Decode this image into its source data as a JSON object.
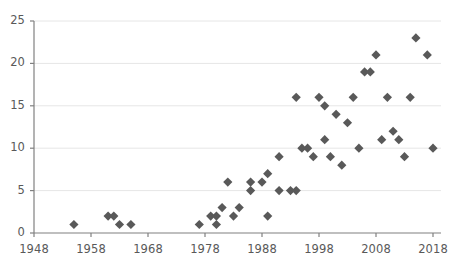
{
  "chart_data": {
    "type": "scatter",
    "title": "",
    "subtitle": "",
    "xlabel": "",
    "ylabel": "",
    "xlim": [
      1948,
      2018
    ],
    "ylim": [
      0,
      25
    ],
    "xticks": [
      1948,
      1958,
      1968,
      1978,
      1988,
      1998,
      2008,
      2018
    ],
    "yticks": [
      0,
      5,
      10,
      15,
      20,
      25
    ],
    "xtick_labels": [
      "1948",
      "1958",
      "1968",
      "1978",
      "1988",
      "1998",
      "2008",
      "2018"
    ],
    "ytick_labels": [
      "0",
      "5",
      "10",
      "15",
      "20",
      "25"
    ],
    "grid": "horizontal",
    "legend": "none",
    "marker": "diamond",
    "marker_color": "#595959",
    "grid_color": "#e6e6e6",
    "axis_color": "#808080",
    "tick_label_color": "#595959",
    "background_color": "#ffffff",
    "series": [
      {
        "name": "series-1",
        "points": [
          [
            1955,
            1
          ],
          [
            1961,
            2
          ],
          [
            1962,
            2
          ],
          [
            1963,
            1
          ],
          [
            1965,
            1
          ],
          [
            1977,
            1
          ],
          [
            1979,
            2
          ],
          [
            1980,
            1
          ],
          [
            1980,
            2
          ],
          [
            1981,
            3
          ],
          [
            1982,
            6
          ],
          [
            1983,
            2
          ],
          [
            1984,
            3
          ],
          [
            1986,
            6
          ],
          [
            1986,
            5
          ],
          [
            1988,
            6
          ],
          [
            1989,
            7
          ],
          [
            1989,
            2
          ],
          [
            1991,
            9
          ],
          [
            1991,
            5
          ],
          [
            1993,
            5
          ],
          [
            1994,
            5
          ],
          [
            1994,
            16
          ],
          [
            1995,
            10
          ],
          [
            1996,
            10
          ],
          [
            1997,
            9
          ],
          [
            1998,
            16
          ],
          [
            1999,
            11
          ],
          [
            1999,
            15
          ],
          [
            2000,
            9
          ],
          [
            2001,
            14
          ],
          [
            2002,
            8
          ],
          [
            2003,
            13
          ],
          [
            2004,
            16
          ],
          [
            2005,
            10
          ],
          [
            2006,
            19
          ],
          [
            2007,
            19
          ],
          [
            2008,
            21
          ],
          [
            2009,
            11
          ],
          [
            2010,
            16
          ],
          [
            2011,
            12
          ],
          [
            2012,
            11
          ],
          [
            2013,
            9
          ],
          [
            2014,
            16
          ],
          [
            2015,
            23
          ],
          [
            2017,
            21
          ],
          [
            2018,
            10
          ]
        ]
      }
    ]
  }
}
